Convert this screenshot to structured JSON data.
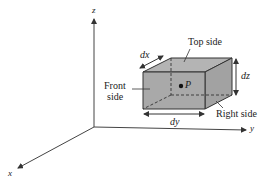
{
  "diagram": {
    "axes": {
      "x": "x",
      "y": "y",
      "z": "z"
    },
    "cube": {
      "labels": {
        "top": "Top side",
        "front_line1": "Front",
        "front_line2": "side",
        "right": "Right side",
        "point": "P"
      },
      "dimensions": {
        "dx": "dx",
        "dy": "dy",
        "dz": "dz"
      }
    },
    "colors": {
      "line": "#333333",
      "face_front": "#a9a9a9",
      "face_top": "#b4b4b4",
      "face_right": "#a2a2a2",
      "background": "#ffffff"
    }
  }
}
